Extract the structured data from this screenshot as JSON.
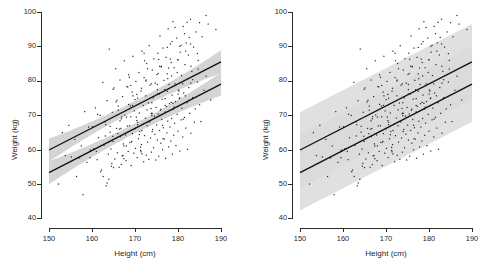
{
  "figure": {
    "panel_count": 2,
    "background_color": "#ffffff"
  },
  "axes": {
    "x_title": "Height (cm)",
    "y_title": "Weight (kg)",
    "x_ticks": [
      "150",
      "160",
      "170",
      "180",
      "190"
    ],
    "y_ticks": [
      "100",
      "90",
      "80",
      "70",
      "60",
      "50",
      "40"
    ],
    "x_min": 150,
    "x_max": 190,
    "y_min": 40,
    "y_max": 100
  },
  "style": {
    "line_color": "#111111",
    "point_color": "#262626",
    "axis_color": "#2b2b2b",
    "band_wide_color": "#d9d9d9",
    "band_narrow_color": "#c9c9c9"
  },
  "chart_data": {
    "type": "scatter",
    "title": "",
    "xlabel": "Height (cm)",
    "ylabel": "Weight (kg)",
    "xlim": [
      150,
      190
    ],
    "ylim": [
      40,
      100
    ],
    "grid": false,
    "legend": "none",
    "panels": [
      {
        "name": "left-panel",
        "interval_type": "confidence",
        "interval_half_width_kg": 2.0,
        "description": "Scatter with two fitted regression lines and narrow 95% confidence bands"
      },
      {
        "name": "right-panel",
        "interval_type": "prediction",
        "interval_half_width_kg": 11.0,
        "description": "Same scatter and fitted lines with wide 95% prediction bands that overlap"
      }
    ],
    "series": [
      {
        "name": "upper-regression-line",
        "type": "line",
        "x": [
          150,
          190
        ],
        "y": [
          59.8,
          85.5
        ],
        "slope_kg_per_cm": 0.6425,
        "intercept_kg": -36.58
      },
      {
        "name": "lower-regression-line",
        "type": "line",
        "x": [
          150,
          190
        ],
        "y": [
          53.2,
          79.0
        ],
        "slope_kg_per_cm": 0.645,
        "intercept_kg": -43.55
      }
    ],
    "scatter": {
      "name": "observations",
      "n_points": 300,
      "x": [
        152.2,
        153.1,
        153.8,
        154.6,
        155.2,
        156.0,
        156.4,
        157.1,
        157.5,
        157.9,
        158.3,
        158.8,
        159.2,
        159.6,
        160.1,
        160.4,
        160.8,
        161.2,
        161.5,
        161.9,
        162.2,
        162.5,
        162.8,
        163.0,
        163.3,
        163.5,
        163.8,
        164.0,
        164.2,
        164.5,
        164.7,
        164.9,
        165.1,
        165.3,
        165.5,
        165.7,
        165.9,
        166.1,
        166.3,
        166.5,
        166.6,
        166.8,
        167.0,
        167.1,
        167.3,
        167.5,
        167.6,
        167.8,
        167.9,
        168.1,
        168.2,
        168.4,
        168.5,
        168.7,
        168.8,
        169.0,
        169.1,
        169.3,
        169.4,
        169.5,
        169.7,
        169.8,
        170.0,
        170.1,
        170.2,
        170.4,
        170.5,
        170.6,
        170.8,
        170.9,
        171.0,
        171.1,
        171.3,
        171.4,
        171.5,
        171.6,
        171.8,
        171.9,
        172.0,
        172.1,
        172.2,
        172.4,
        172.5,
        172.6,
        172.7,
        172.8,
        172.9,
        173.1,
        173.2,
        173.3,
        173.4,
        173.5,
        173.6,
        173.7,
        173.8,
        174.0,
        174.1,
        174.2,
        174.3,
        174.4,
        174.5,
        174.6,
        174.7,
        174.8,
        174.9,
        175.0,
        175.1,
        175.2,
        175.3,
        175.4,
        175.5,
        175.6,
        175.7,
        175.8,
        175.9,
        176.0,
        176.1,
        176.2,
        176.3,
        176.4,
        176.5,
        176.6,
        176.7,
        176.8,
        176.9,
        177.0,
        177.1,
        177.2,
        177.3,
        177.4,
        177.5,
        177.6,
        177.7,
        177.8,
        177.9,
        178.0,
        178.1,
        178.2,
        178.3,
        178.4,
        178.5,
        178.6,
        178.7,
        178.8,
        178.9,
        179.0,
        179.1,
        179.2,
        179.3,
        179.4,
        179.5,
        179.7,
        179.8,
        179.9,
        180.0,
        180.1,
        180.3,
        180.4,
        180.5,
        180.7,
        180.8,
        180.9,
        181.1,
        181.2,
        181.3,
        181.5,
        181.6,
        181.8,
        181.9,
        182.1,
        182.2,
        182.4,
        182.5,
        182.7,
        182.9,
        183.0,
        183.2,
        183.4,
        183.6,
        183.8,
        184.0,
        184.2,
        184.5,
        184.7,
        185.0,
        185.3,
        185.6,
        186.0,
        186.5,
        187.0,
        187.6,
        188.2,
        188.8,
        162.0,
        163.2,
        164.4,
        165.6,
        166.8,
        168.0,
        169.2,
        170.4,
        171.6,
        172.8,
        174.0,
        175.2,
        176.4,
        177.6,
        178.8,
        180.0,
        181.2,
        163.5,
        164.8,
        166.1,
        167.4,
        168.7,
        170.0,
        171.3,
        172.6,
        173.9,
        175.2,
        176.5,
        177.8,
        179.1,
        180.4,
        181.7,
        183.0,
        165.0,
        166.5,
        168.0,
        169.5,
        171.0,
        172.5,
        174.0,
        175.5,
        177.0,
        178.5,
        180.0,
        181.5,
        183.0,
        184.5,
        161.0,
        162.6,
        164.2,
        165.8,
        167.4,
        169.0,
        170.6,
        172.2,
        173.8,
        175.4,
        177.0,
        178.6,
        180.2,
        181.8,
        183.4,
        185.0,
        159.5,
        161.3,
        163.1,
        164.9,
        166.7,
        168.5,
        170.3,
        172.1,
        173.9,
        175.7,
        177.5,
        179.3,
        181.1,
        182.9,
        184.7,
        186.5,
        167.2,
        169.4,
        171.6,
        173.8,
        176.0,
        178.2,
        180.4,
        182.6,
        164.6,
        166.9,
        169.2,
        171.5,
        173.8,
        176.1,
        178.4,
        180.7,
        166.0,
        168.3,
        170.6,
        172.9,
        175.2,
        177.5,
        179.8,
        182.1,
        163.9,
        166.4,
        168.9,
        171.4
      ],
      "y": [
        49.9,
        64.9,
        58.2,
        67.0,
        57.8,
        62.9,
        52.1,
        57.5,
        61.0,
        46.8,
        71.0,
        56.2,
        66.5,
        59.8,
        66.6,
        60.2,
        72.1,
        57.0,
        63.4,
        69.9,
        54.0,
        79.5,
        61.2,
        68.0,
        49.4,
        74.2,
        58.6,
        89.2,
        65.0,
        55.1,
        70.8,
        62.3,
        77.9,
        57.2,
        83.5,
        66.1,
        59.0,
        72.6,
        54.8,
        80.2,
        63.7,
        68.9,
        58.1,
        75.4,
        61.6,
        85.8,
        70.0,
        64.2,
        56.7,
        78.3,
        66.8,
        59.4,
        73.1,
        81.0,
        62.0,
        69.5,
        55.3,
        76.7,
        64.6,
        87.1,
        58.9,
        71.2,
        66.0,
        60.3,
        79.8,
        68.4,
        57.6,
        74.9,
        63.1,
        82.4,
        70.6,
        65.2,
        59.7,
        77.0,
        61.4,
        88.6,
        67.3,
        72.8,
        56.4,
        80.9,
        64.0,
        69.1,
        75.6,
        58.3,
        85.0,
        66.9,
        62.1,
        73.5,
        57.1,
        90.2,
        68.0,
        78.7,
        63.3,
        71.9,
        59.2,
        83.1,
        65.8,
        75.0,
        60.5,
        86.4,
        69.7,
        64.4,
        79.3,
        56.9,
        72.2,
        67.1,
        81.8,
        62.7,
        88.0,
        70.3,
        58.0,
        76.1,
        65.5,
        93.0,
        71.4,
        61.8,
        84.2,
        68.7,
        74.6,
        59.9,
        89.5,
        66.3,
        80.1,
        63.0,
        77.4,
        70.9,
        57.4,
        86.8,
        72.5,
        64.8,
        82.0,
        68.2,
        95.1,
        60.7,
        78.9,
        73.3,
        66.5,
        90.7,
        62.4,
        85.3,
        69.0,
        75.8,
        58.6,
        97.2,
        71.7,
        64.1,
        83.8,
        67.6,
        79.1,
        73.9,
        61.1,
        92.4,
        70.2,
        86.1,
        65.3,
        77.3,
        74.8,
        59.5,
        88.3,
        68.6,
        81.5,
        72.0,
        63.6,
        95.8,
        76.4,
        69.3,
        84.7,
        66.2,
        91.0,
        73.6,
        60.0,
        87.5,
        78.0,
        70.5,
        97.9,
        64.7,
        82.7,
        75.1,
        89.8,
        67.9,
        71.8,
        94.2,
        79.6,
        85.9,
        73.0,
        68.1,
        92.8,
        77.2,
        81.3,
        96.5,
        74.4,
        101.2,
        94.9,
        53.5,
        67.2,
        60.1,
        73.8,
        55.6,
        69.4,
        62.3,
        76.0,
        58.7,
        71.5,
        65.2,
        78.9,
        67.0,
        80.6,
        73.4,
        86.1,
        68.8,
        50.2,
        63.8,
        71.4,
        57.3,
        66.9,
        74.5,
        60.6,
        80.2,
        69.8,
        77.4,
        63.1,
        83.7,
        72.3,
        90.0,
        75.6,
        84.2,
        54.7,
        68.3,
        61.0,
        75.6,
        64.3,
        79.9,
        70.5,
        86.2,
        72.8,
        81.4,
        76.1,
        93.7,
        79.3,
        87.9,
        59.4,
        52.1,
        66.7,
        74.3,
        61.0,
        78.6,
        67.2,
        85.8,
        70.5,
        82.1,
        74.8,
        91.4,
        77.0,
        88.6,
        80.3,
        96.9,
        57.6,
        70.2,
        63.9,
        77.5,
        66.1,
        81.7,
        69.4,
        88.0,
        73.6,
        84.2,
        76.9,
        95.5,
        79.1,
        90.7,
        83.4,
        99.0,
        58.2,
        72.8,
        65.5,
        79.1,
        71.7,
        86.3,
        75.0,
        92.6,
        55.9,
        69.5,
        62.2,
        77.8,
        70.4,
        84.0,
        73.7,
        90.3,
        64.6,
        78.2,
        67.9,
        83.5,
        76.1,
        89.7,
        82.4,
        97.0,
        51.3,
        65.9,
        72.6,
        59.3
      ]
    }
  }
}
